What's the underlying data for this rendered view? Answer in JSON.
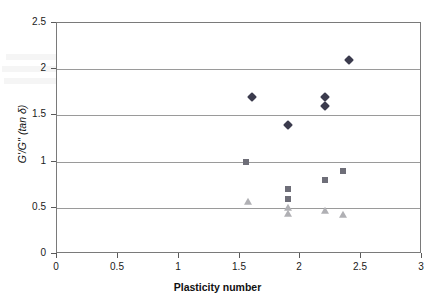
{
  "chart_data": {
    "type": "scatter",
    "title": "",
    "xlabel": "Plasticity number",
    "ylabel": "G'/G'' (tan δ)",
    "xlim": [
      0,
      3
    ],
    "ylim": [
      0,
      2.5
    ],
    "xticks": [
      "0",
      "0.5",
      "1",
      "1.5",
      "2",
      "2.5",
      "3"
    ],
    "xtick_values": [
      0,
      0.5,
      1,
      1.5,
      2,
      2.5,
      3
    ],
    "yticks": [
      "0",
      "0.5",
      "1",
      "1.5",
      "2",
      "2.5"
    ],
    "ytick_values": [
      0,
      0.5,
      1,
      1.5,
      2,
      2.5
    ],
    "grid": "horizontal",
    "legend": "none",
    "series": [
      {
        "name": "series-diamond",
        "marker": "diamond",
        "color": "#3b3b4d",
        "points": [
          {
            "x": 1.6,
            "y": 1.7
          },
          {
            "x": 1.9,
            "y": 1.4
          },
          {
            "x": 2.2,
            "y": 1.7
          },
          {
            "x": 2.2,
            "y": 1.6
          },
          {
            "x": 2.4,
            "y": 2.1
          }
        ]
      },
      {
        "name": "series-square",
        "marker": "square",
        "color": "#6e6e78",
        "points": [
          {
            "x": 1.55,
            "y": 1.0
          },
          {
            "x": 1.9,
            "y": 0.7
          },
          {
            "x": 1.9,
            "y": 0.6
          },
          {
            "x": 2.2,
            "y": 0.8
          },
          {
            "x": 2.35,
            "y": 0.9
          }
        ]
      },
      {
        "name": "series-triangle",
        "marker": "triangle",
        "color": "#b0b0b4",
        "points": [
          {
            "x": 1.57,
            "y": 0.56
          },
          {
            "x": 1.9,
            "y": 0.5
          },
          {
            "x": 1.9,
            "y": 0.43
          },
          {
            "x": 2.2,
            "y": 0.47
          },
          {
            "x": 2.35,
            "y": 0.42
          }
        ]
      }
    ]
  },
  "axes": {
    "x_title": "Plasticity number",
    "y_title": "G'/G'' (tan δ)"
  },
  "colors": {
    "frame": "#7a7a7a",
    "grid": "#9a9a9a",
    "diamond": "#3b3b4d",
    "square": "#6e6e78",
    "triangle": "#b0b0b4",
    "text": "#111111",
    "background": "#ffffff"
  }
}
